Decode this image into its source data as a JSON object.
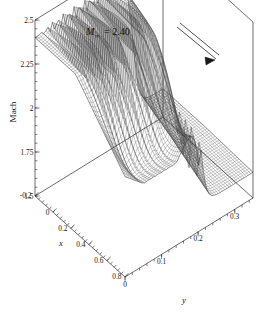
{
  "figure": {
    "kind": "3d-surface-mesh-plot",
    "background_color": "#ffffff",
    "line_color": "#3c3c3c",
    "axis_color": "#2b2b2b"
  },
  "annotation": {
    "mach_symbol": "M",
    "mach_subscript": "∞",
    "equals_value": "= 2.40",
    "full_text": "M∞ = 2.40",
    "arrow_name": "flow-direction-arrow"
  },
  "axes": {
    "z": {
      "label": "Mach",
      "min": 1.5,
      "max": 2.5,
      "ticks": [
        1.5,
        1.75,
        2,
        2.25,
        2.5
      ],
      "tick_labels": [
        "1.5",
        "1.75",
        "2",
        "2.25",
        "2.5"
      ],
      "minor_per_major": 5
    },
    "x": {
      "label": "x",
      "min": -0.2,
      "max": 0.8,
      "ticks": [
        -0.2,
        0,
        0.2,
        0.4,
        0.6,
        0.8
      ],
      "tick_labels": [
        "-0.2",
        "0",
        "0.2",
        "0.4",
        "0.6",
        "0.8"
      ],
      "minor_per_major": 5
    },
    "y": {
      "label": "y",
      "min": 0,
      "max": 0.35,
      "ticks": [
        0,
        0.1,
        0.2,
        0.3
      ],
      "tick_labels": [
        "0",
        "0.1",
        "0.2",
        "0.3"
      ],
      "minor_per_major": 5
    }
  },
  "chart_data": {
    "type": "line",
    "xlabel": "y",
    "ylabel": "x",
    "zlabel": "Mach",
    "xlim": [
      0,
      0.35
    ],
    "ylim": [
      -0.2,
      0.8
    ],
    "zlim": [
      1.5,
      2.5
    ],
    "grid": false,
    "legend": "none",
    "surface": {
      "nx": 46,
      "ny": 60,
      "x_start": -0.2,
      "x_end": 0.8,
      "y_start": 0.0,
      "y_end": 0.35,
      "model": {
        "plateau_mach": 2.4,
        "post_shock_mach": 1.66,
        "shock_y_at_xmin": 0.268,
        "shock_y_at_xmax": 0.205,
        "shock_width": 0.016,
        "ripple_amplitude_max": 0.165,
        "ripple_cycles": 15,
        "ripple_x_center": 0.16,
        "ripple_x_width": 0.3,
        "ripple_y_start": 0.015,
        "ripple_y_end": 0.235,
        "front_dip_depth": 0.2,
        "front_dip_x": 0.62
      }
    },
    "series": [
      {
        "name": "Mach surface mesh",
        "note": "wireframe, no color legend"
      }
    ],
    "key_values": {
      "freestream_mach": 2.4,
      "plateau_level": 2.4,
      "oscillation_band_mach": [
        2.02,
        2.35
      ],
      "downstream_level": 1.66,
      "shock_location_y": 0.24
    }
  },
  "projection": {
    "origin_px": [
      35,
      196
    ],
    "x_axis_vector_px": [
      90,
      81
    ],
    "y_axis_vector_px": [
      128,
      -79
    ],
    "z_axis_height_px": 176,
    "note": "oblique 3D projection corners measured from screenshot"
  }
}
